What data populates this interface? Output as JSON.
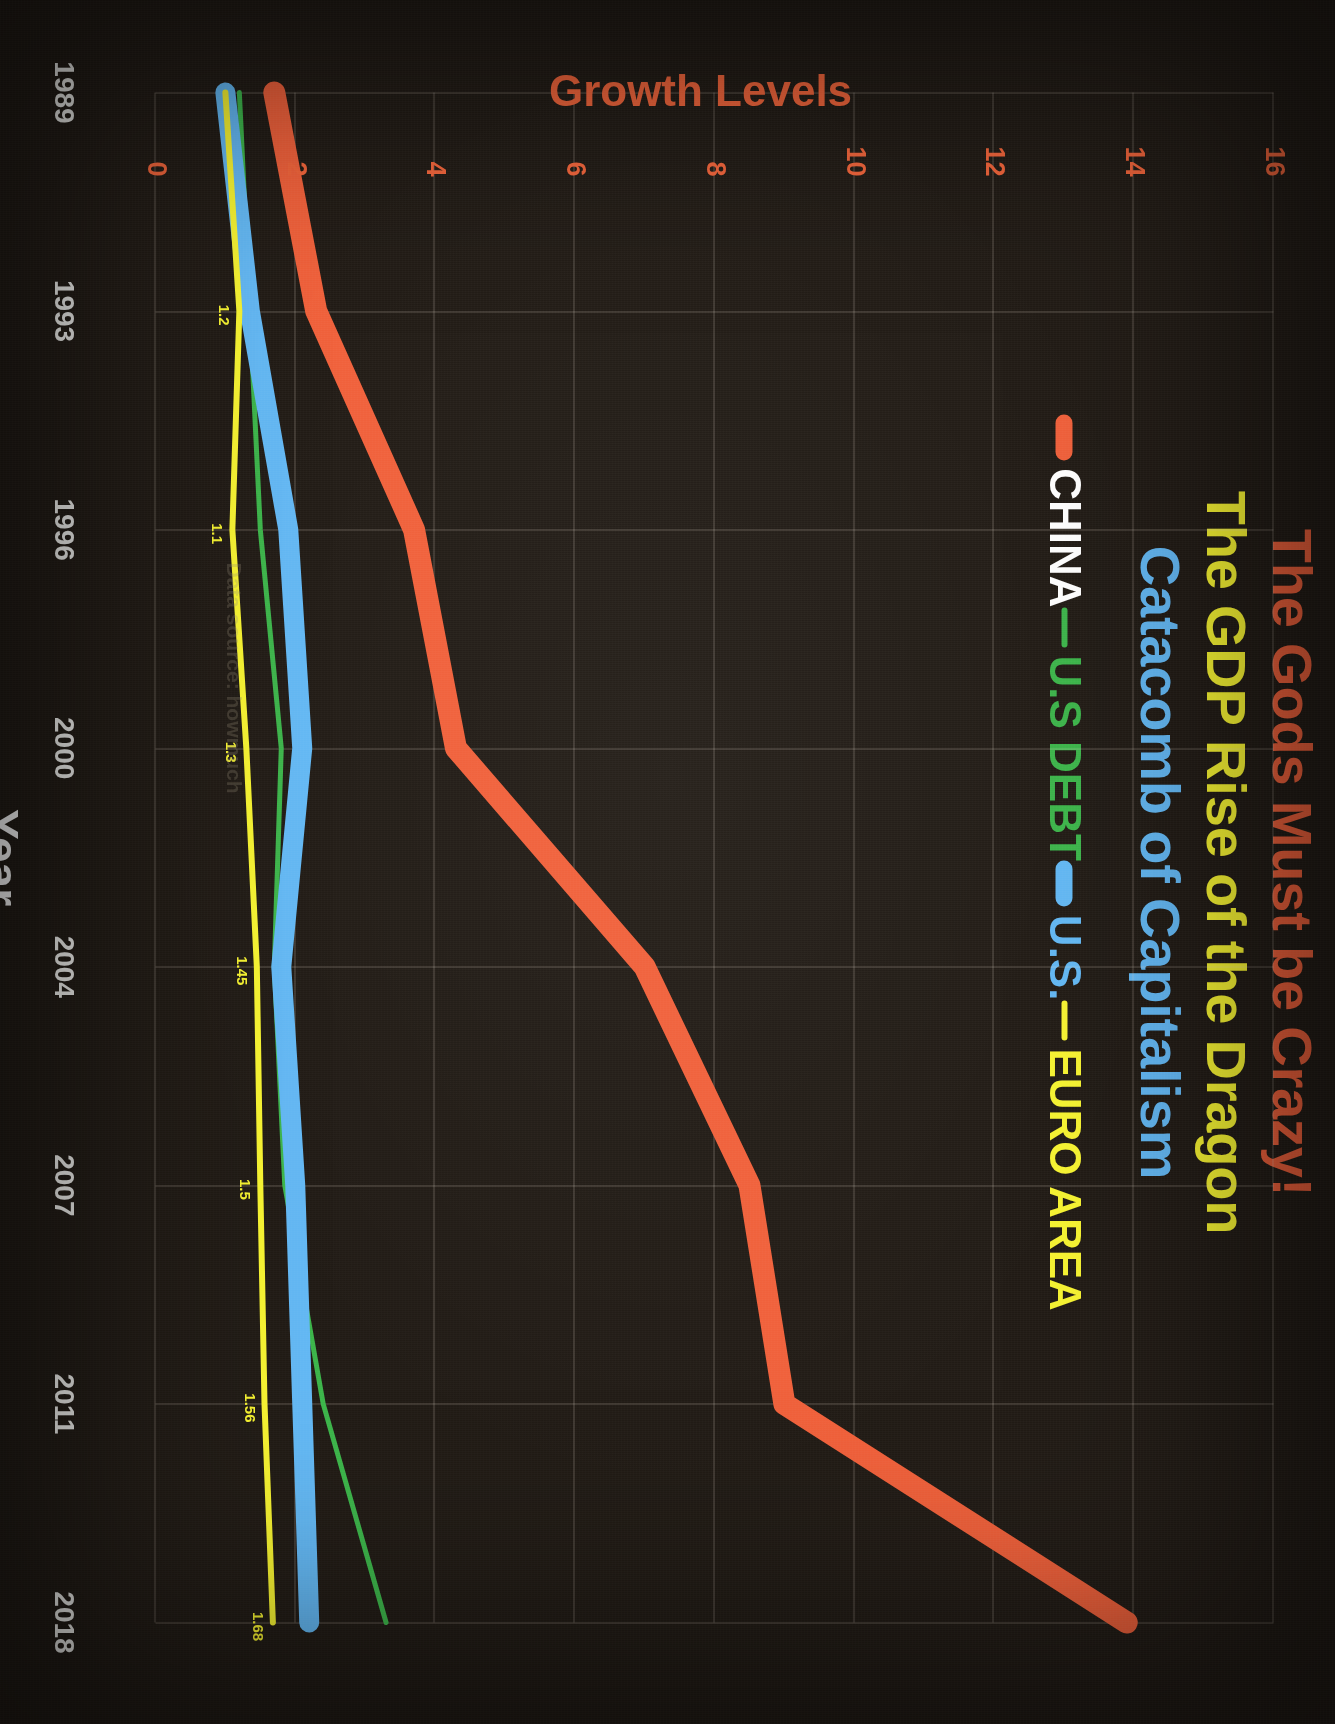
{
  "titles": {
    "line1": "The Gods Must be Crazy!",
    "line2": "The GDP Rise of the Dragon",
    "line3": "Catacomb of Capitalism",
    "color1": "#F0603A",
    "color2": "#F7F431",
    "color3": "#63B8F4"
  },
  "legend": {
    "items": [
      {
        "label": "CHINA",
        "color": "#F0603A",
        "style": "thick"
      },
      {
        "label": "U.S DEBT",
        "color": "#3CB54A",
        "style": "thin"
      },
      {
        "label": "U.S.",
        "color": "#63B8F4",
        "style": "thick"
      },
      {
        "label": "EURO AREA",
        "color": "#F7F431",
        "style": "thin"
      }
    ]
  },
  "watermark": "Data source: howmuch",
  "chart_data": {
    "type": "line",
    "title": "The GDP Rise of the Dragon",
    "xlabel": "Year",
    "ylabel": "Growth Levels",
    "x": [
      "1989",
      "1993",
      "1996",
      "2000",
      "2004",
      "2007",
      "2011",
      "2018"
    ],
    "xticks": [
      "1989",
      "1993",
      "1996",
      "2000",
      "2004",
      "2007",
      "2011",
      "2018"
    ],
    "yticks": [
      0,
      2,
      4,
      6,
      8,
      10,
      12,
      14,
      16
    ],
    "ylim": [
      0,
      16
    ],
    "grid": true,
    "legend_position": "top",
    "series": [
      {
        "name": "CHINA",
        "color": "#F0603A",
        "width": 22,
        "values": [
          1.7,
          2.3,
          3.7,
          4.3,
          7.0,
          8.5,
          9.0,
          13.9
        ]
      },
      {
        "name": "U.S DEBT",
        "color": "#3CB54A",
        "width": 5,
        "values": [
          1.2,
          1.35,
          1.5,
          1.8,
          1.7,
          1.85,
          2.4,
          3.3
        ]
      },
      {
        "name": "U.S.",
        "color": "#63B8F4",
        "width": 20,
        "values": [
          1.0,
          1.35,
          1.9,
          2.1,
          1.8,
          2.0,
          2.1,
          2.2
        ]
      },
      {
        "name": "EURO AREA",
        "color": "#F7F431",
        "width": 6,
        "values": [
          1.0,
          1.2,
          1.1,
          1.3,
          1.45,
          1.5,
          1.56,
          1.68
        ]
      }
    ],
    "data_labels": [
      {
        "series": "EURO AREA",
        "x": "1993",
        "text": "1.2"
      },
      {
        "series": "EURO AREA",
        "x": "1996",
        "text": "1.1"
      },
      {
        "series": "EURO AREA",
        "x": "2000",
        "text": "1.3"
      },
      {
        "series": "EURO AREA",
        "x": "2004",
        "text": "1.45"
      },
      {
        "series": "EURO AREA",
        "x": "2007",
        "text": "1.5"
      },
      {
        "series": "EURO AREA",
        "x": "2011",
        "text": "1.56"
      },
      {
        "series": "EURO AREA",
        "x": "2018",
        "text": "1.68"
      }
    ]
  }
}
